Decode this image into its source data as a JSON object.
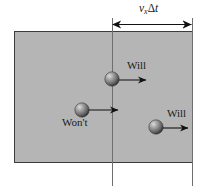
{
  "figure": {
    "width": 207,
    "height": 192,
    "background_color": "#ffffff",
    "region": {
      "name": "shaded-volume",
      "fill_color": "#b5b5b5",
      "border_color": "#3c3c3c",
      "x": 14,
      "y": 31,
      "width": 179,
      "height": 132
    },
    "dimension_label": {
      "variable": "v",
      "subscript": "x",
      "delta": "Δ",
      "time": "t",
      "full_text": "vₓΔt"
    },
    "lines": [
      {
        "name": "boundary-line-left",
        "x": 112,
        "y_top": 18,
        "y_bottom": 186,
        "color": "#6f6f6f"
      },
      {
        "name": "boundary-line-right",
        "x": 193,
        "y_top": 18,
        "y_bottom": 186,
        "color": "#6f6f6f"
      }
    ],
    "dimension_arrow": {
      "y": 24,
      "x_start": 112,
      "x_end": 192,
      "color": "#111111"
    },
    "particles": [
      {
        "id": "particle-top",
        "label": "Will",
        "cx": 112,
        "cy": 79,
        "r": 7,
        "arrow_x_end": 148,
        "arrow_y": 80,
        "label_x": 127,
        "label_y": 60
      },
      {
        "id": "particle-middle",
        "label": "Won't",
        "cx": 82,
        "cy": 110,
        "r": 7,
        "arrow_x_end": 120,
        "arrow_y": 110,
        "label_x": 62,
        "label_y": 117
      },
      {
        "id": "particle-right",
        "label": "Will",
        "cx": 156,
        "cy": 127,
        "r": 7,
        "arrow_x_end": 190,
        "arrow_y": 128,
        "label_x": 167,
        "label_y": 108
      }
    ],
    "colors": {
      "sphere_highlight": "#d8d8d8",
      "sphere_mid": "#8a8a8a",
      "sphere_dark": "#3a3a3a",
      "arrow_color": "#111111",
      "shade_fill": "#b5b5b5"
    }
  }
}
